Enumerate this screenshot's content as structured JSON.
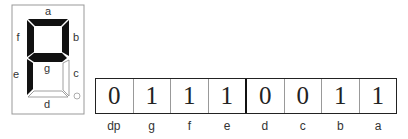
{
  "display": {
    "segment_labels": {
      "a": "a",
      "b": "b",
      "c": "c",
      "d": "d",
      "e": "e",
      "f": "f",
      "g": "g"
    },
    "lit_segments": [
      "a",
      "b",
      "f",
      "g",
      "e"
    ],
    "unlit_segments": [
      "c",
      "d",
      "dp"
    ],
    "dp_glyph": "o",
    "colors": {
      "lit": "#111111",
      "unlit": "#ffffff",
      "outline": "#888888",
      "frame": "#999999"
    }
  },
  "bit_table": {
    "cells": [
      {
        "label": "dp",
        "value": "0"
      },
      {
        "label": "g",
        "value": "1"
      },
      {
        "label": "f",
        "value": "1"
      },
      {
        "label": "e",
        "value": "1"
      },
      {
        "label": "d",
        "value": "0"
      },
      {
        "label": "c",
        "value": "0"
      },
      {
        "label": "b",
        "value": "1"
      },
      {
        "label": "a",
        "value": "1"
      }
    ]
  }
}
